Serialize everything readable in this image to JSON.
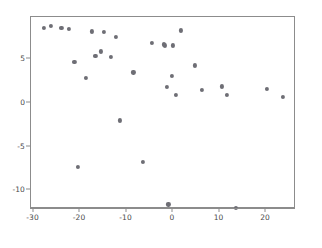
{
  "chart_data": {
    "type": "scatter",
    "title": "",
    "xlabel": "",
    "ylabel": "",
    "xlim": [
      -31.0,
      26.5
    ],
    "ylim": [
      -13.5,
      9.8
    ],
    "grid": false,
    "legend": null,
    "marker": {
      "color": "#6e6e75",
      "shape": "circle",
      "size": 4.2
    },
    "xticks": [
      -30,
      -20,
      -10,
      0,
      10,
      20
    ],
    "xtick_labels": [
      "-30",
      "-20",
      "-10",
      "0",
      "10",
      "20"
    ],
    "yticks": [
      5,
      0,
      -5,
      -10
    ],
    "ytick_labels": [
      "5",
      "0",
      "-5",
      "-10"
    ],
    "n_points": 32,
    "points": [
      {
        "x": -27.7,
        "y": 8.6
      },
      {
        "x": -26.3,
        "y": 8.8
      },
      {
        "x": -22.4,
        "y": 8.5
      },
      {
        "x": -21.2,
        "y": 4.7
      },
      {
        "x": -20.5,
        "y": -7.3
      },
      {
        "x": -18.7,
        "y": 2.9
      },
      {
        "x": -17.5,
        "y": 8.2
      },
      {
        "x": -16.7,
        "y": 5.4
      },
      {
        "x": -15.5,
        "y": 5.9
      },
      {
        "x": -14.8,
        "y": 8.1
      },
      {
        "x": -13.3,
        "y": 5.3
      },
      {
        "x": -12.2,
        "y": 7.6
      },
      {
        "x": -11.5,
        "y": -2.0
      },
      {
        "x": -8.5,
        "y": 3.5
      },
      {
        "x": -6.5,
        "y": -6.7
      },
      {
        "x": -4.6,
        "y": 6.9
      },
      {
        "x": -1.8,
        "y": 6.6
      },
      {
        "x": -1.3,
        "y": 1.8
      },
      {
        "x": -1.0,
        "y": -11.6
      },
      {
        "x": -0.3,
        "y": 3.1
      },
      {
        "x": -0.1,
        "y": 6.6
      },
      {
        "x": 0.7,
        "y": 0.9
      },
      {
        "x": 1.7,
        "y": 8.3
      },
      {
        "x": 4.7,
        "y": 4.3
      },
      {
        "x": 6.3,
        "y": 1.5
      },
      {
        "x": 10.6,
        "y": 1.9
      },
      {
        "x": 11.6,
        "y": 0.9
      },
      {
        "x": 13.6,
        "y": -12.0
      },
      {
        "x": 20.2,
        "y": 1.6
      },
      {
        "x": 23.6,
        "y": 0.7
      },
      {
        "x": -24.0,
        "y": 8.6
      },
      {
        "x": -2.0,
        "y": 6.7
      }
    ]
  },
  "figure": {
    "background_color": "#ffffff",
    "frame_color": "#8c8c8c",
    "tick_color": "#4a4a4a"
  }
}
